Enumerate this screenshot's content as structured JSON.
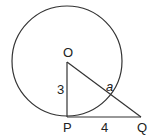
{
  "diagram": {
    "points": {
      "O": "O",
      "P": "P",
      "Q": "Q"
    },
    "segments": {
      "OP": "3",
      "PQ": "4"
    },
    "angle_label": "a",
    "stroke": "#333333"
  }
}
